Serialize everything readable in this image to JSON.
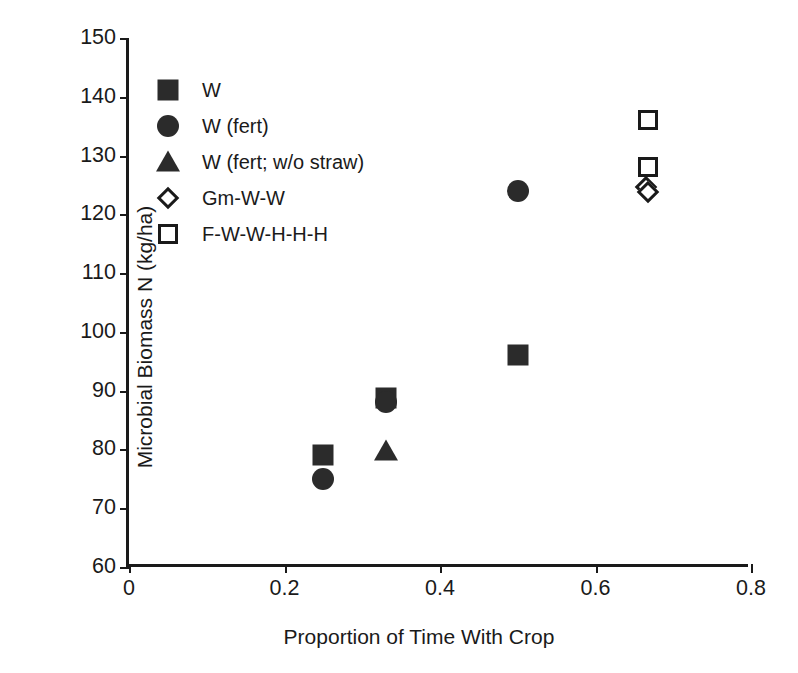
{
  "chart_data": {
    "type": "scatter",
    "title": "",
    "xlabel": "Proportion of Time With Crop",
    "ylabel": "Microbial Biomass N (kg/ha)",
    "xlim": [
      0,
      0.8
    ],
    "ylim": [
      60,
      150
    ],
    "xticks": [
      "0",
      "0.2",
      "0.4",
      "0.6",
      "0.8"
    ],
    "xtick_values": [
      0,
      0.2,
      0.4,
      0.6,
      0.8
    ],
    "yticks": [
      "60",
      "70",
      "80",
      "90",
      "100",
      "110",
      "120",
      "130",
      "140",
      "150"
    ],
    "ytick_values": [
      60,
      70,
      80,
      90,
      100,
      110,
      120,
      130,
      140,
      150
    ],
    "grid": false,
    "legend_position": "upper-left-inside",
    "series": [
      {
        "name": "W",
        "marker": "filled-square",
        "points": [
          {
            "x": 0.25,
            "y": 79.0
          },
          {
            "x": 0.33,
            "y": 88.8
          },
          {
            "x": 0.5,
            "y": 96.0
          }
        ]
      },
      {
        "name": "W (fert)",
        "marker": "filled-circle",
        "points": [
          {
            "x": 0.25,
            "y": 75.0
          },
          {
            "x": 0.33,
            "y": 88.0
          },
          {
            "x": 0.5,
            "y": 124.0
          }
        ]
      },
      {
        "name": "W (fert; w/o straw)",
        "marker": "filled-triangle",
        "points": [
          {
            "x": 0.33,
            "y": 79.8
          }
        ]
      },
      {
        "name": "Gm-W-W",
        "marker": "open-diamond",
        "points": [
          {
            "x": 0.665,
            "y": 124.6
          },
          {
            "x": 0.668,
            "y": 123.8
          }
        ]
      },
      {
        "name": "F-W-W-H-H-H",
        "marker": "open-square",
        "points": [
          {
            "x": 0.668,
            "y": 136.0
          },
          {
            "x": 0.668,
            "y": 128.0
          }
        ]
      }
    ]
  },
  "axis": {
    "y_title": "Microbial Biomass N (kg/ha)",
    "x_title": "Proportion of Time With Crop"
  },
  "legend": {
    "entries": [
      {
        "label": "W",
        "marker": "filled-square"
      },
      {
        "label": "W (fert)",
        "marker": "filled-circle"
      },
      {
        "label": "W (fert; w/o straw)",
        "marker": "filled-triangle"
      },
      {
        "label": "Gm-W-W",
        "marker": "open-diamond"
      },
      {
        "label": "F-W-W-H-H-H",
        "marker": "open-square"
      }
    ]
  },
  "colors": {
    "marker_fill": "#2b2b2b",
    "axis": "#1a1a1a",
    "background": "#ffffff"
  }
}
